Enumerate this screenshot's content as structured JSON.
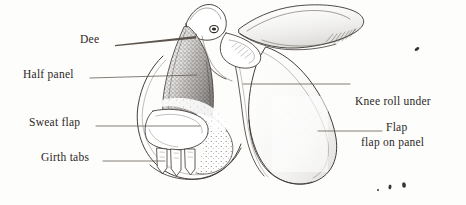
{
  "figure": {
    "style": "pen-and-ink line engraving",
    "background_color": "#fdfdfc",
    "ink_color": "#3a3430",
    "leader_line_color": "#5b534c"
  },
  "labels": [
    {
      "id": "dee",
      "text": "Dee",
      "x": 88,
      "y": 38,
      "align": "left",
      "leader": {
        "from_x": 115,
        "from_y": 44,
        "to_x": 196,
        "to_y": 37,
        "style": "tapered-wedge"
      }
    },
    {
      "id": "half-panel",
      "text": "Half panel",
      "x": 24,
      "y": 72,
      "align": "left",
      "leader": {
        "from_x": 90,
        "from_y": 78,
        "to_x": 197,
        "to_y": 75,
        "style": "plain"
      }
    },
    {
      "id": "sweat-flap",
      "text": "Sweat flap",
      "x": 30,
      "y": 120,
      "align": "left",
      "leader": {
        "from_x": 96,
        "from_y": 126,
        "to_x": 200,
        "to_y": 126,
        "style": "plain"
      }
    },
    {
      "id": "girth-tabs",
      "text": "Girth tabs",
      "x": 42,
      "y": 155,
      "align": "left",
      "leader": {
        "from_x": 103,
        "from_y": 161,
        "to_x": 165,
        "to_y": 161,
        "style": "plain"
      }
    },
    {
      "id": "knee-roll",
      "text": "Knee roll under",
      "text_line2": "flap on panel",
      "x": 355,
      "y": 72,
      "align": "left",
      "leader": {
        "from_x": 350,
        "from_y": 84,
        "to_x": 243,
        "to_y": 84,
        "style": "plain"
      }
    },
    {
      "id": "flap",
      "text": "Flap",
      "x": 386,
      "y": 125,
      "align": "left",
      "leader": {
        "from_x": 382,
        "from_y": 131,
        "to_x": 318,
        "to_y": 131,
        "style": "plain"
      }
    }
  ],
  "specks": [
    {
      "x": 417,
      "y": 49,
      "w": 5,
      "h": 3,
      "rot": -35
    },
    {
      "x": 378,
      "y": 190,
      "w": 2,
      "h": 2,
      "rot": 0
    },
    {
      "x": 390,
      "y": 186,
      "w": 3,
      "h": 5,
      "rot": 10
    },
    {
      "x": 404,
      "y": 184,
      "w": 4,
      "h": 6,
      "rot": -8
    }
  ]
}
